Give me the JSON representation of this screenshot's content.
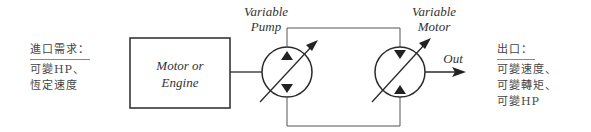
{
  "diagram": {
    "input_block": {
      "heading": "進口需求：",
      "lines": [
        "可變HP、",
        "恆定速度"
      ]
    },
    "source_box": {
      "line1": "Motor or",
      "line2": "Engine"
    },
    "pump": {
      "label_line1": "Variable",
      "label_line2": "Pump"
    },
    "motor": {
      "label_line1": "Variable",
      "label_line2": "Motor"
    },
    "output_arrow_label": "Out",
    "output_block": {
      "heading": "出口：",
      "lines": [
        "可變速度、",
        "可變轉矩、",
        "可變HP"
      ]
    },
    "colors": {
      "stroke": "#2a2a2a",
      "text": "#333333"
    }
  }
}
